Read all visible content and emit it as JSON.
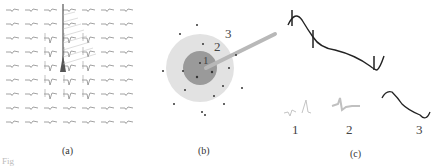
{
  "panels": {
    "a": {
      "caption": "(a)",
      "grid": {
        "rows": 9,
        "cols": 7
      },
      "description": "Grid of extracellular waveforms with electrode shank overlay"
    },
    "b": {
      "caption": "(b)",
      "zone_labels": [
        "1",
        "2",
        "3"
      ],
      "description": "Concentric zones around electrode tip with neuron dots"
    },
    "c": {
      "caption": "(c)",
      "trace_labels": [
        "1",
        "2",
        "3"
      ],
      "description": "Composite trace decomposed into spikes, intermediate, and slow components"
    }
  },
  "footer": {
    "fig_label": "Fig"
  },
  "colors": {
    "waveform": "#7a7a7a",
    "electrode": "#555555",
    "outer_zone": "#e2e2e2",
    "inner_zone": "#9a9a9a",
    "probe": "#b5b5b5",
    "trace": "#222222",
    "faint_trace": "#c4c4c4"
  }
}
